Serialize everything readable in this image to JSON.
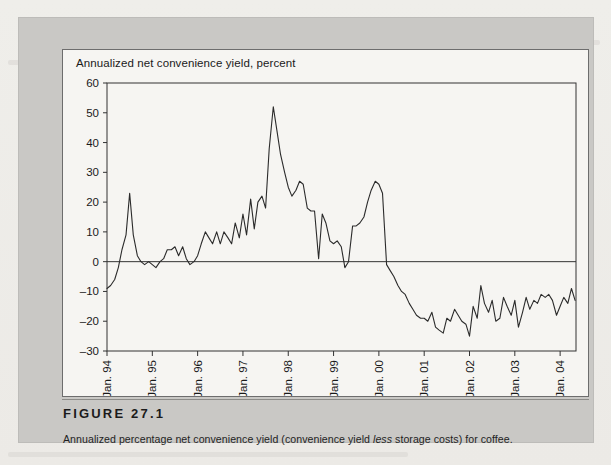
{
  "figure": {
    "label": "FIGURE 27.1",
    "caption_before": "Annualized percentage net convenience yield (convenience yield ",
    "caption_emphasis": "less",
    "caption_after": " storage costs) for coffee."
  },
  "chart_data": {
    "type": "line",
    "title": "Annualized net convenience yield, percent",
    "xlabel": "",
    "ylabel": "Annualized net convenience yield, percent",
    "ylim": [
      -30,
      60
    ],
    "yticks": [
      60,
      50,
      40,
      30,
      20,
      10,
      0,
      -10,
      -20,
      -30
    ],
    "yticklabels": [
      "60",
      "50",
      "40",
      "30",
      "20",
      "10",
      "0",
      "–10",
      "–20",
      "–30"
    ],
    "xlim": [
      1994.0,
      2004.35
    ],
    "xticks": [
      1994,
      1995,
      1996,
      1997,
      1998,
      1999,
      2000,
      2001,
      2002,
      2003,
      2004
    ],
    "xticklabels": [
      "Jan. 94",
      "Jan. 95",
      "Jan. 96",
      "Jan. 97",
      "Jan. 98",
      "Jan. 99",
      "Jan. 00",
      "Jan. 01",
      "Jan. 02",
      "Jan. 03",
      "Jan. 04"
    ],
    "grid": false,
    "legend": null,
    "zero_line": 0,
    "line_color": "#2b2b2b",
    "series": [
      {
        "name": "Coffee net convenience yield",
        "x": [
          1994.0,
          1994.08,
          1994.17,
          1994.25,
          1994.33,
          1994.42,
          1994.5,
          1994.58,
          1994.67,
          1994.75,
          1994.83,
          1994.92,
          1995.0,
          1995.08,
          1995.17,
          1995.25,
          1995.33,
          1995.42,
          1995.5,
          1995.58,
          1995.67,
          1995.75,
          1995.83,
          1995.92,
          1996.0,
          1996.08,
          1996.17,
          1996.25,
          1996.33,
          1996.42,
          1996.5,
          1996.58,
          1996.67,
          1996.75,
          1996.83,
          1996.92,
          1997.0,
          1997.08,
          1997.17,
          1997.25,
          1997.33,
          1997.42,
          1997.5,
          1997.58,
          1997.67,
          1997.75,
          1997.83,
          1997.92,
          1998.0,
          1998.08,
          1998.17,
          1998.25,
          1998.33,
          1998.42,
          1998.5,
          1998.58,
          1998.67,
          1998.75,
          1998.83,
          1998.92,
          1999.0,
          1999.08,
          1999.17,
          1999.25,
          1999.33,
          1999.42,
          1999.5,
          1999.58,
          1999.67,
          1999.75,
          1999.83,
          1999.92,
          2000.0,
          2000.08,
          2000.17,
          2000.25,
          2000.33,
          2000.42,
          2000.5,
          2000.58,
          2000.67,
          2000.75,
          2000.83,
          2000.92,
          2001.0,
          2001.08,
          2001.17,
          2001.25,
          2001.33,
          2001.42,
          2001.5,
          2001.58,
          2001.67,
          2001.75,
          2001.83,
          2001.92,
          2002.0,
          2002.08,
          2002.17,
          2002.25,
          2002.33,
          2002.42,
          2002.5,
          2002.58,
          2002.67,
          2002.75,
          2002.83,
          2002.92,
          2003.0,
          2003.08,
          2003.17,
          2003.25,
          2003.33,
          2003.42,
          2003.5,
          2003.58,
          2003.67,
          2003.75,
          2003.83,
          2003.92,
          2004.0,
          2004.08,
          2004.17,
          2004.25,
          2004.33
        ],
        "y": [
          -9,
          -8,
          -6,
          -2,
          4,
          9,
          23,
          9,
          2,
          0,
          -1,
          0,
          -1,
          -2,
          0,
          1,
          4,
          4,
          5,
          2,
          5,
          1,
          -1,
          0,
          2,
          6,
          10,
          8,
          6,
          10,
          6,
          10,
          8,
          6,
          13,
          8,
          16,
          9,
          21,
          11,
          20,
          22,
          18,
          38,
          52,
          44,
          36,
          30,
          25,
          22,
          24,
          27,
          26,
          18,
          17,
          17,
          1,
          16,
          13,
          7,
          6,
          7,
          5,
          -2,
          0,
          12,
          12,
          13,
          15,
          20,
          24,
          27,
          26,
          23,
          -1,
          -3,
          -5,
          -8,
          -10,
          -11,
          -14,
          -16,
          -18,
          -19,
          -19,
          -20,
          -17,
          -22,
          -23,
          -24,
          -19,
          -20,
          -16,
          -18,
          -20,
          -21,
          -25,
          -15,
          -19,
          -8,
          -14,
          -17,
          -13,
          -20,
          -19,
          -12,
          -15,
          -18,
          -13,
          -22,
          -17,
          -12,
          -16,
          -13,
          -14,
          -11,
          -12,
          -11,
          -13,
          -18,
          -15,
          -12,
          -14,
          -9,
          -13
        ]
      }
    ]
  }
}
